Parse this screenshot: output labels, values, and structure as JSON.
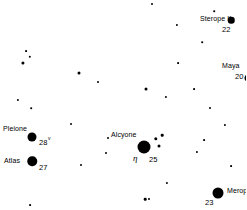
{
  "chart_data": {
    "type": "scatter",
    "xlabel": "",
    "ylabel": "",
    "xlim": [
      0,
      246
    ],
    "ylim": [
      0,
      210
    ],
    "grid": false,
    "legend": "none",
    "background_color": "#ffffff",
    "star_color": "#000000",
    "note": "Star chart field; dot diameter encodes apparent brightness (larger = brighter).",
    "labeled_stars": [
      {
        "name": "Sterope II",
        "flamsteed": "22",
        "x": 231,
        "y": 20,
        "size": 6.5,
        "label_x": 200,
        "label_y": 15,
        "number_x": 222,
        "number_y": 26
      },
      {
        "name": "Maya",
        "flamsteed": "20",
        "x": 248,
        "y": 78,
        "size": 7,
        "label_x": 222,
        "label_y": 62,
        "number_x": 235,
        "number_y": 73
      },
      {
        "name": "Pleione",
        "flamsteed": "28",
        "x": 32,
        "y": 137,
        "size": 9,
        "label_x": 3,
        "label_y": 125,
        "number_x": 39,
        "number_y": 139,
        "variable_mark": "v",
        "variable_x": 48,
        "variable_y": 136
      },
      {
        "name": "Atlas",
        "flamsteed": "27",
        "x": 32,
        "y": 161,
        "size": 9.5,
        "label_x": 4,
        "label_y": 157,
        "number_x": 39,
        "number_y": 164
      },
      {
        "name": "Alcyone",
        "flamsteed": "25",
        "greek": "η",
        "x": 144,
        "y": 147,
        "size": 13,
        "label_x": 111,
        "label_y": 131,
        "number_x": 149,
        "number_y": 156,
        "greek_x": 133,
        "greek_y": 154
      },
      {
        "name": "Merope",
        "flamsteed": "23",
        "x": 218,
        "y": 193,
        "size": 11,
        "label_x": 227,
        "label_y": 187,
        "number_x": 205,
        "number_y": 199
      }
    ],
    "field_stars": [
      {
        "x": 152,
        "y": 4,
        "size": 2
      },
      {
        "x": 214,
        "y": 11,
        "size": 1.6
      },
      {
        "x": 177,
        "y": 25,
        "size": 2.2
      },
      {
        "x": 202,
        "y": 42,
        "size": 1.6
      },
      {
        "x": 26,
        "y": 51,
        "size": 1.8
      },
      {
        "x": 30,
        "y": 57,
        "size": 2.4
      },
      {
        "x": 23,
        "y": 63,
        "size": 3.2
      },
      {
        "x": 178,
        "y": 63,
        "size": 1.8
      },
      {
        "x": 79,
        "y": 73,
        "size": 3
      },
      {
        "x": 98,
        "y": 82,
        "size": 2
      },
      {
        "x": 146,
        "y": 89,
        "size": 3
      },
      {
        "x": 194,
        "y": 89,
        "size": 1.8
      },
      {
        "x": 166,
        "y": 97,
        "size": 2.2
      },
      {
        "x": 18,
        "y": 100,
        "size": 2.2
      },
      {
        "x": 31,
        "y": 108,
        "size": 1.6
      },
      {
        "x": 210,
        "y": 108,
        "size": 2
      },
      {
        "x": 71,
        "y": 124,
        "size": 2
      },
      {
        "x": 225,
        "y": 125,
        "size": 2.2
      },
      {
        "x": 108,
        "y": 138,
        "size": 2
      },
      {
        "x": 156,
        "y": 139,
        "size": 3.4
      },
      {
        "x": 162,
        "y": 135,
        "size": 2.6
      },
      {
        "x": 159,
        "y": 146,
        "size": 3
      },
      {
        "x": 204,
        "y": 140,
        "size": 1.8
      },
      {
        "x": 106,
        "y": 153,
        "size": 2
      },
      {
        "x": 197,
        "y": 152,
        "size": 2.2
      },
      {
        "x": 81,
        "y": 165,
        "size": 2
      },
      {
        "x": 231,
        "y": 166,
        "size": 1.8
      },
      {
        "x": 167,
        "y": 183,
        "size": 2.2
      },
      {
        "x": 145,
        "y": 199,
        "size": 2.6
      },
      {
        "x": 149,
        "y": 199,
        "size": 2
      },
      {
        "x": 30,
        "y": 205,
        "size": 1.8
      }
    ]
  }
}
